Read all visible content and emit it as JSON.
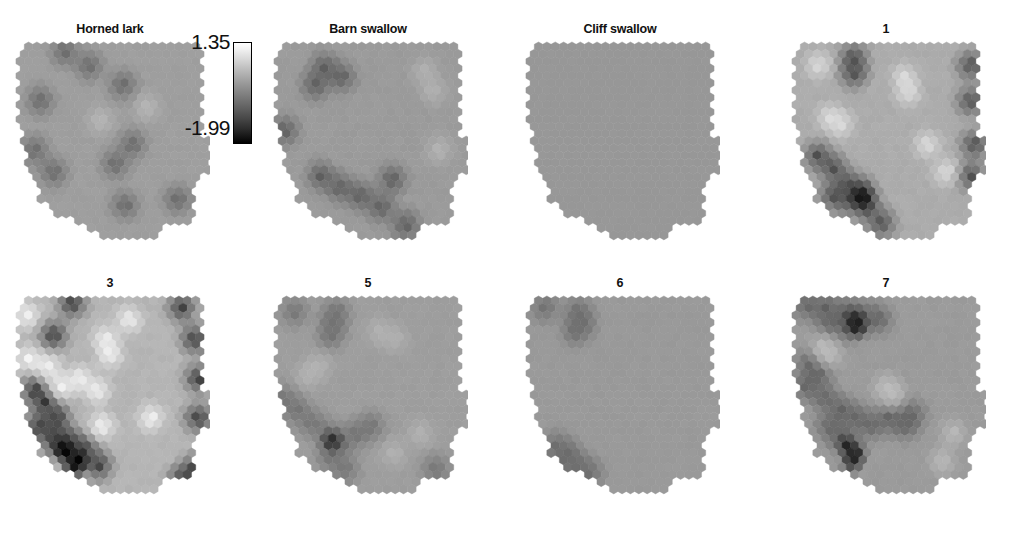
{
  "figure": {
    "type": "small-multiples hexbin choropleth maps of the western United States",
    "clipped_header_text": "",
    "background_color": "#ffffff",
    "rows": 2,
    "columns": 4
  },
  "colorbar": {
    "orientation": "vertical",
    "max_label": "1.35",
    "min_label": "-1.99",
    "max_value": 1.35,
    "min_value": -1.99,
    "top_color": "#ffffff",
    "bottom_color": "#000000",
    "colormap": "grayscale"
  },
  "panels": [
    {
      "id": "horned-lark",
      "title": "Horned lark",
      "row": 0,
      "col": 0
    },
    {
      "id": "barn-swallow",
      "title": "Barn swallow",
      "row": 0,
      "col": 1
    },
    {
      "id": "cliff-swallow",
      "title": "Cliff swallow",
      "row": 0,
      "col": 2
    },
    {
      "id": "cluster-1",
      "title": "1",
      "row": 0,
      "col": 3
    },
    {
      "id": "cluster-3",
      "title": "3",
      "row": 1,
      "col": 0
    },
    {
      "id": "cluster-5",
      "title": "5",
      "row": 1,
      "col": 1
    },
    {
      "id": "cluster-6",
      "title": "6",
      "row": 1,
      "col": 2
    },
    {
      "id": "cluster-7",
      "title": "7",
      "row": 1,
      "col": 3
    }
  ],
  "chart_data": {
    "type": "heatmap",
    "title": "",
    "xlabel": "",
    "ylabel": "",
    "legend_position": "top-left inset",
    "grid": false,
    "value_range": [
      -1.99,
      1.35
    ],
    "colormap": "grayscale (white = high, black = low)",
    "projection_note": "hexagonal binning over western United States outline",
    "hex_grid": {
      "cols": 22,
      "rows": 24,
      "radius": 5.2
    },
    "series": [
      {
        "name": "Horned lark",
        "mean": -0.22,
        "contrast": 0.45,
        "description": "mostly uniform mid-gray with scattered darker patches along Pacific coast, Sierra Nevada and Arizona/New Mexico border",
        "dark_patch_centers": [
          [
            0.13,
            0.3
          ],
          [
            0.1,
            0.55
          ],
          [
            0.2,
            0.66
          ],
          [
            0.39,
            0.12
          ],
          [
            0.57,
            0.22
          ],
          [
            0.62,
            0.52
          ],
          [
            0.53,
            0.62
          ],
          [
            0.58,
            0.83
          ],
          [
            0.86,
            0.8
          ],
          [
            0.26,
            0.05
          ]
        ],
        "light_patch_centers": [
          [
            0.45,
            0.4
          ],
          [
            0.7,
            0.33
          ]
        ],
        "base_value": -0.15,
        "dark_value": -0.95,
        "light_value": 0.25
      },
      {
        "name": "Barn swallow",
        "mean": -0.35,
        "contrast": 0.6,
        "description": "large dark blobs in Pacific Northwest/Idaho and across southern Nevada-Arizona; lighter band in far east",
        "dark_patch_centers": [
          [
            0.27,
            0.13
          ],
          [
            0.36,
            0.18
          ],
          [
            0.22,
            0.22
          ],
          [
            0.06,
            0.45
          ],
          [
            0.25,
            0.68
          ],
          [
            0.35,
            0.74
          ],
          [
            0.46,
            0.78
          ],
          [
            0.57,
            0.84
          ],
          [
            0.63,
            0.7
          ],
          [
            0.7,
            0.93
          ]
        ],
        "light_patch_centers": [
          [
            0.85,
            0.25
          ],
          [
            0.88,
            0.55
          ],
          [
            0.8,
            0.15
          ]
        ],
        "base_value": -0.2,
        "dark_value": -1.1,
        "light_value": 0.2
      },
      {
        "name": "Cliff swallow",
        "mean": -0.25,
        "contrast": 0.03,
        "description": "essentially flat uniform mid-gray across entire region",
        "dark_patch_centers": [],
        "light_patch_centers": [],
        "base_value": -0.25,
        "dark_value": -0.3,
        "light_value": -0.2
      },
      {
        "name": "1",
        "mean": -0.1,
        "contrast": 0.95,
        "description": "light northwest and central interior; very dark cluster in southern California/Arizona corner and eastern margin",
        "dark_patch_centers": [
          [
            0.33,
            0.08
          ],
          [
            0.33,
            0.16
          ],
          [
            0.95,
            0.12
          ],
          [
            0.95,
            0.3
          ],
          [
            0.97,
            0.52
          ],
          [
            0.14,
            0.58
          ],
          [
            0.22,
            0.64
          ],
          [
            0.3,
            0.72
          ],
          [
            0.38,
            0.76
          ],
          [
            0.3,
            0.8
          ],
          [
            0.4,
            0.84
          ],
          [
            0.22,
            0.78
          ],
          [
            0.48,
            0.92
          ],
          [
            0.95,
            0.68
          ]
        ],
        "very_dark_centers": [
          [
            0.36,
            0.78
          ],
          [
            0.38,
            0.8
          ]
        ],
        "light_patch_centers": [
          [
            0.2,
            0.38
          ],
          [
            0.26,
            0.42
          ],
          [
            0.6,
            0.18
          ],
          [
            0.62,
            0.26
          ],
          [
            0.72,
            0.52
          ],
          [
            0.82,
            0.66
          ],
          [
            0.14,
            0.12
          ]
        ],
        "base_value": 0.05,
        "dark_value": -1.3,
        "light_value": 0.85
      },
      {
        "name": "3",
        "mean": 0.05,
        "contrast": 1.2,
        "description": "bright interior Great Basin with several near-white cells; strongly dark southern California/Arizona and southeast corner",
        "dark_patch_centers": [
          [
            0.3,
            0.04
          ],
          [
            0.88,
            0.06
          ],
          [
            0.95,
            0.22
          ],
          [
            0.97,
            0.42
          ],
          [
            0.97,
            0.62
          ],
          [
            0.1,
            0.48
          ],
          [
            0.16,
            0.54
          ],
          [
            0.22,
            0.62
          ],
          [
            0.12,
            0.66
          ],
          [
            0.2,
            0.72
          ],
          [
            0.28,
            0.74
          ],
          [
            0.36,
            0.78
          ],
          [
            0.44,
            0.86
          ],
          [
            0.95,
            0.88
          ],
          [
            0.88,
            0.94
          ],
          [
            0.2,
            0.2
          ]
        ],
        "very_dark_centers": [
          [
            0.28,
            0.8
          ],
          [
            0.34,
            0.84
          ],
          [
            0.24,
            0.78
          ],
          [
            0.3,
            0.88
          ],
          [
            0.97,
            0.95
          ]
        ],
        "light_patch_centers": [
          [
            0.07,
            0.32
          ],
          [
            0.17,
            0.36
          ],
          [
            0.34,
            0.42
          ],
          [
            0.48,
            0.22
          ],
          [
            0.5,
            0.3
          ],
          [
            0.43,
            0.48
          ],
          [
            0.24,
            0.46
          ],
          [
            0.6,
            0.12
          ],
          [
            0.72,
            0.62
          ],
          [
            0.46,
            0.66
          ],
          [
            0.06,
            0.1
          ]
        ],
        "base_value": 0.18,
        "dark_value": -1.55,
        "light_value": 1.2
      },
      {
        "name": "5",
        "mean": -0.22,
        "contrast": 0.42,
        "description": "broad flat mid-gray with darker band across southern Nevada/Arizona and a narrow dark spur in northern Idaho",
        "dark_patch_centers": [
          [
            0.11,
            0.08
          ],
          [
            0.33,
            0.08
          ],
          [
            0.32,
            0.14
          ],
          [
            0.3,
            0.2
          ],
          [
            0.05,
            0.52
          ],
          [
            0.12,
            0.58
          ],
          [
            0.2,
            0.64
          ],
          [
            0.28,
            0.7
          ],
          [
            0.36,
            0.74
          ],
          [
            0.44,
            0.7
          ],
          [
            0.52,
            0.66
          ],
          [
            0.3,
            0.82
          ],
          [
            0.38,
            0.88
          ],
          [
            0.86,
            0.88
          ]
        ],
        "very_dark_centers": [
          [
            0.31,
            0.74
          ]
        ],
        "light_patch_centers": [
          [
            0.18,
            0.4
          ],
          [
            0.24,
            0.36
          ],
          [
            0.56,
            0.18
          ],
          [
            0.64,
            0.22
          ],
          [
            0.78,
            0.7
          ],
          [
            0.64,
            0.8
          ]
        ],
        "base_value": -0.16,
        "dark_value": -0.8,
        "light_value": 0.18
      },
      {
        "name": "6",
        "mean": -0.28,
        "contrast": 0.35,
        "description": "nearly flat mid-gray; one dark blob in Washington/Idaho panhandle and one in southern California",
        "dark_patch_centers": [
          [
            0.1,
            0.06
          ],
          [
            0.28,
            0.08
          ],
          [
            0.3,
            0.14
          ],
          [
            0.26,
            0.18
          ],
          [
            0.16,
            0.76
          ],
          [
            0.22,
            0.8
          ],
          [
            0.28,
            0.86
          ],
          [
            0.34,
            0.9
          ],
          [
            0.2,
            0.84
          ]
        ],
        "light_patch_centers": [],
        "base_value": -0.22,
        "dark_value": -0.85,
        "light_value": -0.15
      },
      {
        "name": "7",
        "mean": -0.3,
        "contrast": 0.55,
        "description": "dark band across Pacific Northwest and a second band across southern Nevada/Arizona; lighter eastern interior",
        "dark_patch_centers": [
          [
            0.08,
            0.05
          ],
          [
            0.18,
            0.06
          ],
          [
            0.28,
            0.08
          ],
          [
            0.38,
            0.1
          ],
          [
            0.46,
            0.12
          ],
          [
            0.2,
            0.14
          ],
          [
            0.3,
            0.16
          ],
          [
            0.1,
            0.34
          ],
          [
            0.14,
            0.4
          ],
          [
            0.08,
            0.46
          ],
          [
            0.18,
            0.52
          ],
          [
            0.26,
            0.58
          ],
          [
            0.34,
            0.62
          ],
          [
            0.42,
            0.66
          ],
          [
            0.52,
            0.62
          ],
          [
            0.6,
            0.66
          ],
          [
            0.64,
            0.6
          ],
          [
            0.26,
            0.72
          ],
          [
            0.2,
            0.66
          ]
        ],
        "very_dark_centers": [
          [
            0.33,
            0.12
          ],
          [
            0.35,
            0.16
          ],
          [
            0.3,
            0.76
          ],
          [
            0.34,
            0.8
          ],
          [
            0.32,
            0.84
          ]
        ],
        "light_patch_centers": [
          [
            0.16,
            0.26
          ],
          [
            0.2,
            0.3
          ],
          [
            0.5,
            0.46
          ],
          [
            0.54,
            0.5
          ],
          [
            0.86,
            0.7
          ],
          [
            0.8,
            0.84
          ]
        ],
        "base_value": -0.2,
        "dark_value": -1.0,
        "light_value": 0.3
      }
    ]
  }
}
